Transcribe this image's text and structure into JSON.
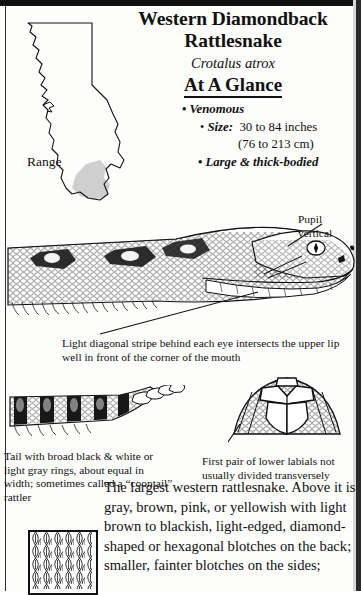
{
  "page": {
    "species_common_name_line1": "Western Diamondback",
    "species_common_name_line2": "Rattlesnake",
    "scientific_name": "Crotalus atrox",
    "section_heading": "At A Glance"
  },
  "at_a_glance": {
    "bullet_glyph": "•",
    "venomous": "Venomous",
    "size_label": "Size:",
    "size_value": "30 to 84 inches",
    "size_metric": "(76 to 213 cm)",
    "build": "Large & thick-bodied"
  },
  "map": {
    "label": "Range",
    "state": "California",
    "range_fill_color": "#cccccc",
    "outline_color": "#1a1a1a"
  },
  "callouts": {
    "pupil_line1": "Pupil",
    "pupil_line2": "vertical",
    "stripe": "Light diagonal stripe behind each eye intersects the upper lip well in front of the corner of the mouth",
    "tail": "Tail with broad black & white or light gray rings, about equal in width; sometimes called a “coontail” rattler",
    "labials": "First pair of lower labials not usually divided transversely"
  },
  "description": {
    "text": "The largest western rattlesnake. Above it is gray, brown, pink, or yellowish with light brown to blackish, light-edged, diamond-shaped or hexagonal blotches on the back; smaller, fainter blotches on the sides;"
  },
  "figures": {
    "head": "snake-head-lateral-view",
    "tail": "snake-tail-with-rattle",
    "chin": "chin-lower-labial-scales",
    "scale_detail": "keeled-dorsal-scales-swatch"
  },
  "colors": {
    "ink": "#111111",
    "paper": "#fdfdfc",
    "edge": "#2a2a2a"
  }
}
